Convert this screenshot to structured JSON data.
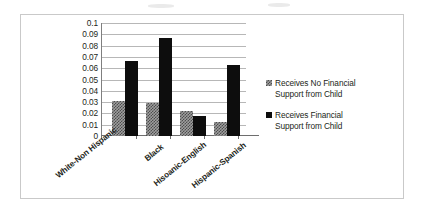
{
  "chart_data": {
    "type": "bar",
    "title": "",
    "subtitle": "",
    "xlabel": "",
    "ylabel": "Predicted Probability of Providing Grandchild Care",
    "categories": [
      "White-Non Hispanic",
      "Black",
      "Hisoanic-English",
      "Hispanic-Spanish"
    ],
    "series": [
      {
        "name": "Receives No Financial Support from Child",
        "values": [
          0.031,
          0.0295,
          0.0225,
          0.012
        ],
        "color": "#9e9e9e",
        "pattern": "checkered"
      },
      {
        "name": "Receives  Financial Support from Child",
        "values": [
          0.066,
          0.087,
          0.018,
          0.063
        ],
        "color": "#0d0d0d",
        "pattern": "solid"
      }
    ],
    "ylim": [
      0,
      0.1
    ],
    "ytick_labels": [
      "0.1",
      "0.09",
      "0.08",
      "0.07",
      "0.06",
      "0.05",
      "0.04",
      "0.03",
      "0.02",
      "0.01",
      "0"
    ],
    "ytick_values": [
      0.1,
      0.09,
      0.08,
      0.07,
      0.06,
      0.05,
      0.04,
      0.03,
      0.02,
      0.01,
      0
    ],
    "grid": true,
    "legend_position": "right"
  },
  "legend": {
    "items": [
      {
        "label_line1": "Receives No Financial",
        "label_line2": "Support from Child",
        "swatch": "checkered-gray-swatch"
      },
      {
        "label_line1": "Receives  Financial",
        "label_line2": "Support from Child",
        "swatch": "solid-black-swatch"
      }
    ]
  }
}
